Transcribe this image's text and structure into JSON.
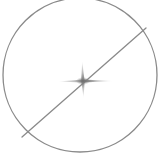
{
  "figure": {
    "width": 166,
    "height": 160,
    "background_color": "#ffffff",
    "stroke_color": "#8a8a8a",
    "sparkle_color": "#7d7d7d",
    "shapes": {
      "circle": {
        "name": "circle-outline",
        "center_x": 80,
        "center_y": 75,
        "radius": 77,
        "stroke_width": 1.3,
        "fill": "none",
        "note": "clipped at top edge of canvas"
      },
      "diameter_line": {
        "name": "diagonal-chord-line",
        "x1": 22,
        "y1": 137,
        "x2": 146,
        "y2": 28,
        "stroke_width": 1.3
      },
      "sparkle": {
        "name": "four-point-sparkle",
        "center_x": 83,
        "center_y": 81,
        "arm_left": 58,
        "arm_right": 113,
        "arm_top": 61,
        "arm_bottom": 98,
        "thickness": 3.2
      }
    }
  }
}
